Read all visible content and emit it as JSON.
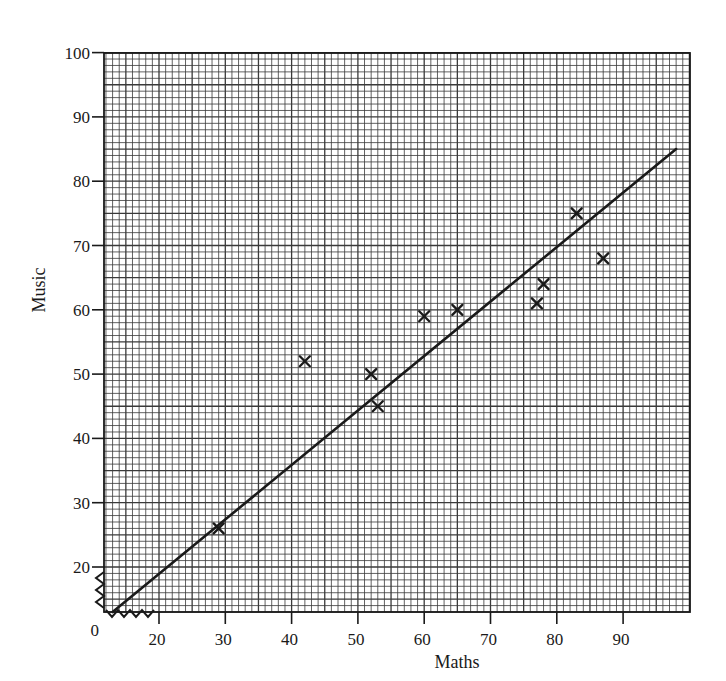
{
  "chart_data": {
    "type": "scatter",
    "title": "",
    "xlabel": "Maths",
    "ylabel": "Music",
    "xlim": [
      0,
      100
    ],
    "ylim": [
      0,
      100
    ],
    "axis_breaks": {
      "x": true,
      "y": true
    },
    "origin_label": "0",
    "x_ticks": [
      20,
      30,
      40,
      50,
      60,
      70,
      80,
      90
    ],
    "y_ticks": [
      20,
      30,
      40,
      50,
      60,
      70,
      80,
      90,
      100
    ],
    "grid": {
      "visible": true,
      "minor_step": 1,
      "major_step": 5
    },
    "legend": null,
    "marker": "x",
    "series": [
      {
        "name": "Students",
        "points": [
          {
            "x": 29,
            "y": 26
          },
          {
            "x": 42,
            "y": 52
          },
          {
            "x": 52,
            "y": 50
          },
          {
            "x": 53,
            "y": 45
          },
          {
            "x": 60,
            "y": 59
          },
          {
            "x": 65,
            "y": 60
          },
          {
            "x": 77,
            "y": 61
          },
          {
            "x": 78,
            "y": 64
          },
          {
            "x": 83,
            "y": 75
          },
          {
            "x": 87,
            "y": 68
          }
        ]
      }
    ],
    "line_of_best_fit": {
      "x1": 13,
      "y1": 13,
      "x2": 98,
      "y2": 85
    }
  },
  "colors": {
    "ink": "#1a1a1a",
    "grid": "#3a3a3a",
    "background": "#ffffff"
  }
}
